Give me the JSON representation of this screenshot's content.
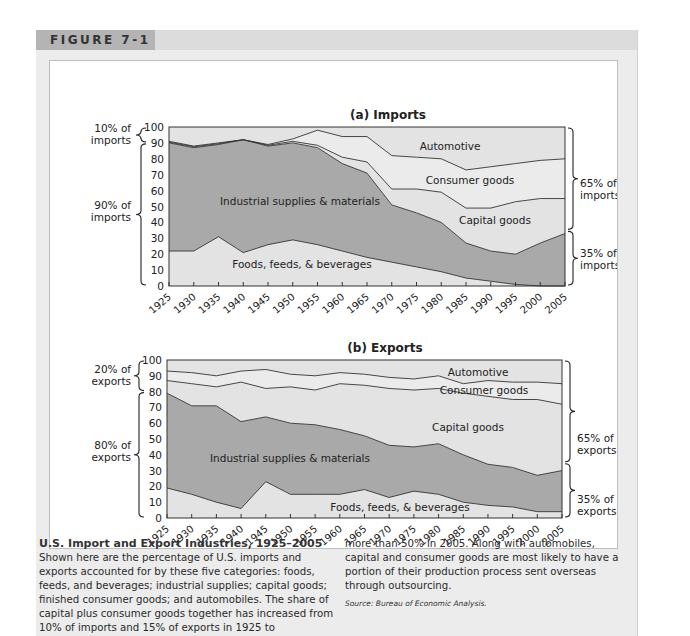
{
  "figure": {
    "tag": "FIGURE 7-1"
  },
  "caption": {
    "title": "U.S. Import and Export Industries, 1925–2005",
    "body_left": "Shown here are the percentage of U.S. imports and exports accounted for by these five categories: foods, feeds, and beverages; industrial supplies; capital goods; finished consumer goods; and automobiles. The share of capital plus consumer goods together has increased from 10% of imports and 15% of exports in 1925 to",
    "body_right": "more than 50% in 2005. Along with automobiles, capital and consumer goods are most likely to have a portion of their production process sent overseas through outsourcing.",
    "source": "Source: Bureau of Economic Analysis."
  },
  "colors": {
    "dark_fill": "#a9a9a9",
    "light_fill": "#e3e3e3",
    "lighter_fill": "#ebebeb",
    "line": "#333333",
    "header_tag": "#b4b4b4",
    "header_bar": "#dcdcdc"
  },
  "chart_data": [
    {
      "type": "area",
      "stacked": true,
      "title": "(a) Imports",
      "xlabel": "",
      "ylabel": "",
      "ylim": [
        0,
        100
      ],
      "yticks": [
        0,
        10,
        20,
        30,
        40,
        50,
        60,
        70,
        80,
        90,
        100
      ],
      "x": [
        1925,
        1930,
        1935,
        1940,
        1945,
        1950,
        1955,
        1960,
        1965,
        1970,
        1975,
        1980,
        1985,
        1990,
        1995,
        2000,
        2005
      ],
      "series": [
        {
          "name": "Foods, feeds, & beverages",
          "values": [
            22,
            22,
            31,
            21,
            26,
            29,
            26,
            22,
            18,
            15,
            12,
            9,
            5,
            3,
            1,
            0,
            0
          ]
        },
        {
          "name": "Industrial supplies & materials",
          "values": [
            68,
            65,
            58,
            71,
            62,
            61,
            61,
            55,
            53,
            36,
            34,
            31,
            22,
            19,
            19,
            27,
            33
          ]
        },
        {
          "name": "Capital goods",
          "values": [
            0.5,
            0.5,
            0.5,
            0,
            0.5,
            1,
            1.5,
            4,
            7,
            10,
            15,
            19,
            22,
            27,
            33,
            28,
            22
          ]
        },
        {
          "name": "Consumer goods",
          "values": [
            0.5,
            0.5,
            0.5,
            0,
            0.5,
            1.5,
            9.5,
            13,
            16,
            21,
            20,
            21,
            24,
            26,
            24,
            24,
            25
          ]
        },
        {
          "name": "Automotive",
          "values": [
            9,
            12,
            10,
            8,
            11,
            7.5,
            1.5,
            6,
            6,
            18,
            19,
            20,
            27,
            25,
            23,
            21,
            20
          ]
        }
      ],
      "cumulative_boundaries": {
        "foods_top": [
          22,
          22,
          31,
          21,
          26,
          29,
          26,
          22,
          18,
          15,
          12,
          9,
          5,
          3,
          1,
          0,
          0
        ],
        "industrial_top": [
          90,
          87,
          89,
          92,
          88,
          90,
          87,
          77,
          71,
          51,
          46,
          40,
          27,
          22,
          20,
          27,
          33
        ],
        "capital_top": [
          90.5,
          87.5,
          89.5,
          92,
          88.5,
          91,
          88.5,
          81,
          78,
          61,
          61,
          59,
          49,
          49,
          53,
          55,
          55
        ],
        "consumer_top": [
          91,
          88,
          90,
          92,
          89,
          92.5,
          98,
          94,
          94,
          82,
          81,
          80,
          73,
          75,
          77,
          79,
          80
        ]
      },
      "area_labels": [
        "Automotive",
        "Consumer goods",
        "Capital goods",
        "Industrial supplies & materials",
        "Foods, feeds, & beverages"
      ],
      "annotations": {
        "left": [
          {
            "text": "10% of imports",
            "range": [
              90,
              100
            ]
          },
          {
            "text": "90% of imports",
            "range": [
              0,
              90
            ]
          }
        ],
        "right": [
          {
            "text": "65% of imports",
            "range": [
              35,
              100
            ]
          },
          {
            "text": "35% of imports",
            "range": [
              0,
              35
            ]
          }
        ]
      }
    },
    {
      "type": "area",
      "stacked": true,
      "title": "(b) Exports",
      "xlabel": "",
      "ylabel": "",
      "ylim": [
        0,
        100
      ],
      "yticks": [
        0,
        10,
        20,
        30,
        40,
        50,
        60,
        70,
        80,
        90,
        100
      ],
      "x": [
        1925,
        1930,
        1935,
        1940,
        1945,
        1950,
        1955,
        1960,
        1965,
        1970,
        1975,
        1980,
        1985,
        1990,
        1995,
        2000,
        2005
      ],
      "series": [
        {
          "name": "Foods, feeds, & beverages",
          "values": [
            19,
            15,
            10,
            6,
            23,
            15,
            15,
            15,
            18,
            13,
            17,
            15,
            10,
            8,
            7,
            4,
            4
          ]
        },
        {
          "name": "Industrial supplies & materials",
          "values": [
            60,
            56,
            61,
            55,
            41,
            45,
            44,
            41,
            34,
            33,
            28,
            32,
            30,
            26,
            25,
            23,
            26
          ]
        },
        {
          "name": "Capital goods",
          "values": [
            8,
            14,
            12,
            25,
            18,
            23,
            22,
            29,
            32,
            36,
            36,
            35,
            39,
            43,
            43,
            48,
            42
          ]
        },
        {
          "name": "Consumer goods",
          "values": [
            6,
            7,
            7,
            7,
            12,
            8,
            9,
            7,
            7,
            7,
            7,
            8,
            6,
            10,
            11,
            11,
            13
          ]
        },
        {
          "name": "Automotive",
          "values": [
            7,
            8,
            10,
            7,
            6,
            9,
            10,
            8,
            9,
            11,
            12,
            10,
            15,
            13,
            14,
            14,
            15
          ]
        }
      ],
      "cumulative_boundaries": {
        "foods_top": [
          19,
          15,
          10,
          6,
          23,
          15,
          15,
          15,
          18,
          13,
          17,
          15,
          10,
          8,
          7,
          4,
          4
        ],
        "industrial_top": [
          79,
          71,
          71,
          61,
          64,
          60,
          59,
          56,
          52,
          46,
          45,
          47,
          40,
          34,
          32,
          27,
          30
        ],
        "capital_top": [
          87,
          85,
          83,
          86,
          82,
          83,
          81,
          85,
          84,
          82,
          81,
          82,
          79,
          77,
          75,
          75,
          72
        ],
        "consumer_top": [
          93,
          92,
          90,
          93,
          94,
          91,
          90,
          92,
          91,
          89,
          88,
          90,
          85,
          87,
          86,
          86,
          85
        ]
      },
      "area_labels": [
        "Automotive",
        "Consumer goods",
        "Capital goods",
        "Industrial supplies & materials",
        "Foods, feeds, & beverages"
      ],
      "annotations": {
        "left": [
          {
            "text": "20% of exports",
            "range": [
              80,
              100
            ]
          },
          {
            "text": "80% of exports",
            "range": [
              0,
              80
            ]
          }
        ],
        "right": [
          {
            "text": "65% of exports",
            "range": [
              35,
              100
            ]
          },
          {
            "text": "35% of exports",
            "range": [
              0,
              35
            ]
          }
        ]
      }
    }
  ],
  "layout": {
    "imports": {
      "plot": {
        "x0": 119,
        "x1": 515,
        "y_top": 66,
        "y_bottom": 225
      },
      "title_pos": [
        338,
        58
      ],
      "label_pos": {
        "Automotive": [
          400,
          89
        ],
        "Consumer goods": [
          420,
          123
        ],
        "Capital goods": [
          445,
          163
        ],
        "Industrial supplies & materials": [
          250,
          144
        ],
        "Foods, feeds, & beverages": [
          252,
          207
        ]
      },
      "left_labels": [
        {
          "lines": [
            "10% of",
            "imports"
          ],
          "x": 53,
          "y": 71
        },
        {
          "lines": [
            "90% of",
            "imports"
          ],
          "x": 53,
          "y": 148
        }
      ],
      "right_labels": [
        {
          "lines": [
            "65% of",
            "imports"
          ],
          "x": 525,
          "y": 126
        },
        {
          "lines": [
            "35% of",
            "imports"
          ],
          "x": 525,
          "y": 196
        }
      ]
    },
    "exports": {
      "plot": {
        "x0": 117,
        "x1": 512,
        "y_top": 299,
        "y_bottom": 457
      },
      "title_pos": [
        335,
        291
      ],
      "label_pos": {
        "Automotive": [
          428,
          315
        ],
        "Consumer goods": [
          434,
          333
        ],
        "Capital goods": [
          418,
          370
        ],
        "Industrial supplies & materials": [
          240,
          401
        ],
        "Foods, feeds, & beverages": [
          350,
          450
        ]
      },
      "left_labels": [
        {
          "lines": [
            "20% of",
            "exports"
          ],
          "x": 53,
          "y": 312
        },
        {
          "lines": [
            "80% of",
            "exports"
          ],
          "x": 53,
          "y": 388
        }
      ],
      "right_labels": [
        {
          "lines": [
            "65% of",
            "exports"
          ],
          "x": 522,
          "y": 381
        },
        {
          "lines": [
            "35% of",
            "exports"
          ],
          "x": 522,
          "y": 442
        }
      ]
    }
  }
}
